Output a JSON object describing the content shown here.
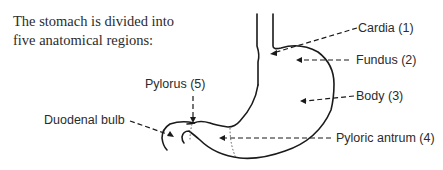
{
  "intro": {
    "line1": "The stomach is divided into",
    "line2": "five anatomical regions:"
  },
  "labels": {
    "cardia": "Cardia (1)",
    "fundus": "Fundus (2)",
    "body": "Body (3)",
    "pyloric_antrum": "Pyloric antrum (4)",
    "pylorus": "Pylorus (5)",
    "duodenal_bulb": "Duodenal bulb"
  },
  "colors": {
    "line": "#1a1a1a",
    "text": "#2b2b2b"
  }
}
